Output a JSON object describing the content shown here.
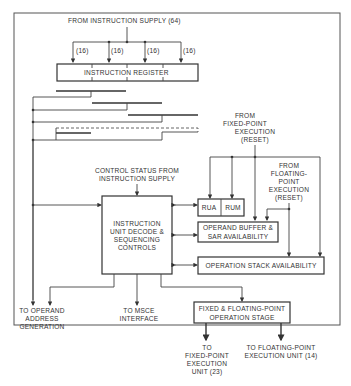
{
  "diagram": {
    "top_input": "FROM INSTRUCTION SUPPLY (64)",
    "bus_widths": [
      "(16)",
      "(16)",
      "(16)",
      "(16)"
    ],
    "instruction_register": "INSTRUCTION REGISTER",
    "fixed_point_reset": [
      "FROM",
      "FIXED-POINT",
      "EXECUTION",
      "(RESET)"
    ],
    "floating_point_reset": [
      "FROM",
      "FLOATING-",
      "POINT",
      "EXECUTION",
      "(RESET)"
    ],
    "control_status": [
      "CONTROL STATUS FROM",
      "INSTRUCTION SUPPLY"
    ],
    "rua": "RUA",
    "rum": "RUM",
    "decode_box": [
      "INSTRUCTION",
      "UNIT DECODE &",
      "SEQUENCING",
      "CONTROLS"
    ],
    "operand_buffer": [
      "OPERAND BUFFER &",
      "SAR AVAILABILITY"
    ],
    "operation_stack": "OPERATION STACK AVAILABILITY",
    "to_operand_address": [
      "TO OPERAND",
      "ADDRESS",
      "GENERATION"
    ],
    "to_msce": [
      "TO MSCE",
      "INTERFACE"
    ],
    "fx_fp_stage": [
      "FIXED & FLOATING-POINT",
      "OPERATION STAGE"
    ],
    "to_fixed_point_unit": [
      "TO",
      "FIXED-POINT",
      "EXECUTION",
      "UNIT (23)"
    ],
    "to_floating_point_unit": [
      "TO FLOATING-POINT",
      "EXECUTION UNIT (14)"
    ]
  }
}
